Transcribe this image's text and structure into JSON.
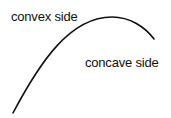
{
  "diagram": {
    "labels": {
      "convex": "convex side",
      "concave": "concave side"
    },
    "curve": {
      "stroke_color": "#111111",
      "stroke_width": 1.6,
      "path": "M 13 113 C 40 62, 70 17, 112 17 C 130 17, 145 27, 154 39"
    }
  }
}
